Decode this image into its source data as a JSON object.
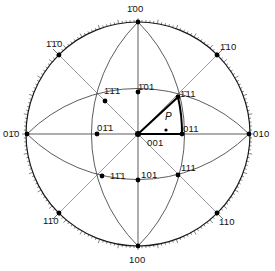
{
  "diagram": {
    "title": "",
    "type": "stereographic-projection",
    "center": {
      "x": 138,
      "y": 134
    },
    "primitive_radius": 112,
    "colors": {
      "line": "#1a1a1a",
      "thin": "#444444",
      "fill": "#000000",
      "background": "#ffffff"
    },
    "poles": [
      {
        "id": "m100",
        "label": "1̄00",
        "x": 138,
        "y": 22,
        "lx": 127,
        "ly": 4
      },
      {
        "id": "p100",
        "label": "100",
        "x": 138,
        "y": 246,
        "lx": 129,
        "ly": 255
      },
      {
        "id": "m010",
        "label": "01̄0",
        "x": 27,
        "y": 134,
        "lx": 3,
        "ly": 129
      },
      {
        "id": "p010",
        "label": "010",
        "x": 249,
        "y": 134,
        "lx": 253,
        "ly": 129
      },
      {
        "id": "m1m10",
        "label": "1̄1̄0",
        "x": 59,
        "y": 55,
        "lx": 46,
        "ly": 39
      },
      {
        "id": "m110",
        "label": "1̄10",
        "x": 217,
        "y": 55,
        "lx": 220,
        "ly": 42
      },
      {
        "id": "p1m10",
        "label": "11̄0",
        "x": 59,
        "y": 213,
        "lx": 43,
        "ly": 216
      },
      {
        "id": "p110",
        "label": "110",
        "x": 217,
        "y": 213,
        "lx": 219,
        "ly": 217
      },
      {
        "id": "m1m11",
        "label": "1̄1̄1",
        "x": 105,
        "y": 101,
        "lx": 104,
        "ly": 86
      },
      {
        "id": "m111",
        "label": "1̄11",
        "x": 178,
        "y": 97,
        "lx": 180,
        "ly": 89
      },
      {
        "id": "p1m11",
        "label": "11̄1",
        "x": 102,
        "y": 176,
        "lx": 110,
        "ly": 171
      },
      {
        "id": "p111",
        "label": "111",
        "x": 178,
        "y": 175,
        "lx": 181,
        "ly": 163
      },
      {
        "id": "m101",
        "label": "1̄01",
        "x": 138,
        "y": 92,
        "lx": 138,
        "ly": 82
      },
      {
        "id": "p101",
        "label": "101",
        "x": 138,
        "y": 180,
        "lx": 141,
        "ly": 170
      },
      {
        "id": "m011",
        "label": "01̄1",
        "x": 97,
        "y": 134,
        "lx": 97,
        "ly": 123
      },
      {
        "id": "p011",
        "label": "011",
        "x": 182,
        "y": 134,
        "lx": 183,
        "ly": 124
      },
      {
        "id": "p001",
        "label": "001",
        "x": 138,
        "y": 134,
        "lx": 147,
        "ly": 138
      }
    ],
    "point_p": {
      "label": "P",
      "x": 166,
      "y": 130,
      "lx": 165,
      "ly": 112
    },
    "unit_triangle": {
      "vertices": [
        "001",
        "011",
        "1̄11"
      ]
    }
  }
}
